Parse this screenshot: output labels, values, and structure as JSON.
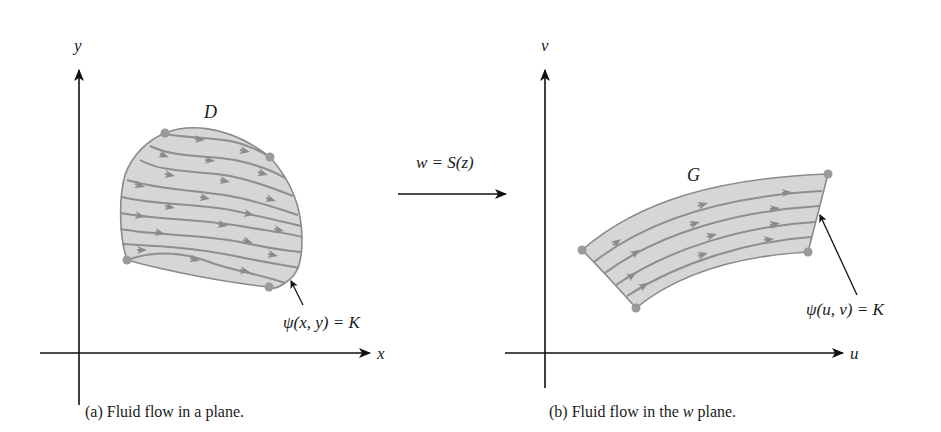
{
  "figure": {
    "transform": {
      "label": "w = S(z)"
    },
    "panel_a": {
      "axis_x_label": "x",
      "axis_y_label": "y",
      "region_label": "D",
      "streamline_label": "ψ(x, y) = K",
      "caption_prefix": "(a) Fluid flow in a plane.",
      "streamline_count": 9,
      "corner_points": 4
    },
    "panel_b": {
      "axis_x_label": "u",
      "axis_y_label": "v",
      "region_label": "G",
      "streamline_label": "ψ(u, v) = K",
      "caption_before": "(b) Fluid flow in the ",
      "caption_var": "w",
      "caption_after": " plane.",
      "streamline_count": 4,
      "corner_points": 4
    },
    "colors": {
      "region_fill": "#d6d6d6",
      "region_stroke": "#8a8a8a",
      "streamline": "#8e8e8e",
      "corner_dot": "#9a9a9a",
      "axis": "#111111"
    }
  }
}
